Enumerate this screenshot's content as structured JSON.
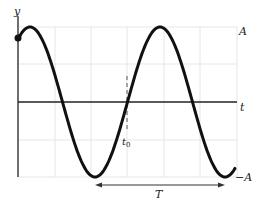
{
  "figure": {
    "type": "sinusoid",
    "labels": {
      "y_axis": "y",
      "t_axis": "t",
      "amplitude_top": "A",
      "amplitude_bottom": "−A",
      "t0": "t",
      "t0_sub": "0",
      "period": "T"
    },
    "colors": {
      "curve": "#111111",
      "axis": "#222222",
      "grid": "#e6e6e6",
      "dashed_marker": "#555555",
      "arrow": "#333333"
    },
    "geometry": {
      "y_axis_x": 18,
      "t_axis_y": 102,
      "peak_y": 27,
      "trough_y": 177,
      "grid_x": [
        55,
        91,
        127,
        164,
        200,
        237
      ],
      "grid_y": [
        27,
        64,
        140,
        177
      ],
      "first_peak_x": 30,
      "period_px": 130,
      "curve_start_x": 18,
      "curve_end_x": 235,
      "start_dot": {
        "x": 18,
        "y": 38
      },
      "t0_x": 127,
      "period_arrow": {
        "x1": 95,
        "x2": 225,
        "y": 185
      }
    }
  }
}
